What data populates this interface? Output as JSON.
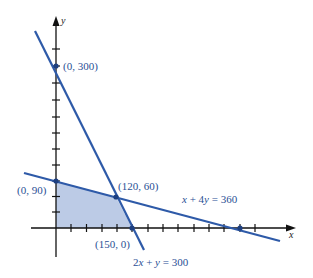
{
  "diagram": {
    "type": "linear-programming-feasible-region",
    "axes": {
      "x_label": "x",
      "y_label": "y"
    },
    "colors": {
      "line": "#2e5aa8",
      "region": "#bccbe6",
      "axis": "#111111",
      "label": "#2a4f95"
    },
    "lines": [
      {
        "equation": "2x + y = 300",
        "label_parts": [
          "2",
          "x",
          " + ",
          "y",
          " = 300"
        ]
      },
      {
        "equation": "x + 4y = 360",
        "label_parts": [
          "x",
          " + 4",
          "y",
          " = 360"
        ]
      }
    ],
    "points": [
      {
        "label": "(0, 300)",
        "x": 0,
        "y": 300
      },
      {
        "label": "(0, 90)",
        "x": 0,
        "y": 90
      },
      {
        "label": "(120, 60)",
        "x": 120,
        "y": 60
      },
      {
        "label": "(150, 0)",
        "x": 150,
        "y": 0
      }
    ],
    "feasible_region_vertices": [
      [
        0,
        0
      ],
      [
        0,
        90
      ],
      [
        120,
        60
      ],
      [
        150,
        0
      ]
    ],
    "tick_spacing": 30
  }
}
